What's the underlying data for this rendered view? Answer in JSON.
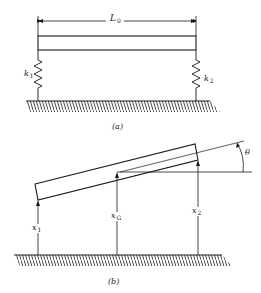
{
  "figure": {
    "panel_a": {
      "caption": "(a)",
      "dimension_label": {
        "main": "L",
        "sub": "0"
      },
      "spring_left": {
        "main": "k",
        "sub": "1"
      },
      "spring_right": {
        "main": "k",
        "sub": "2"
      }
    },
    "panel_b": {
      "caption": "(b)",
      "arrow_left": {
        "main": "x",
        "sub": "1"
      },
      "arrow_center": {
        "main": "x",
        "sub": "G"
      },
      "arrow_right": {
        "main": "x",
        "sub": "2"
      },
      "angle_label": "θ"
    },
    "colors": {
      "ink": "#1a1a1a",
      "background": "#ffffff"
    }
  }
}
